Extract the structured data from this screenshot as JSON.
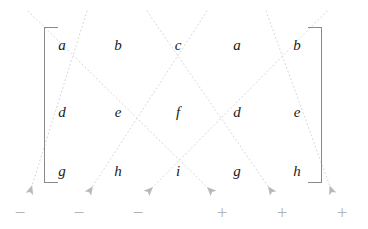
{
  "figure": {
    "name": "rule-of-sarrus-diagram",
    "background_color": "#ffffff",
    "width": 368,
    "height": 229
  },
  "matrix": {
    "rows": [
      [
        "a",
        "b",
        "c",
        "a",
        "b"
      ],
      [
        "d",
        "e",
        "f",
        "d",
        "e"
      ],
      [
        "g",
        "h",
        "i",
        "g",
        "h"
      ]
    ],
    "column_x": [
      62,
      118,
      178,
      237,
      297
    ],
    "row_y": [
      45,
      112,
      171
    ],
    "text_color": "#1a1a1a",
    "bracket_color": "#8a8a8a"
  },
  "signs": {
    "items": [
      {
        "label": "−",
        "x": 20
      },
      {
        "label": "−",
        "x": 79
      },
      {
        "label": "−",
        "x": 138
      },
      {
        "label": "+",
        "x": 222
      },
      {
        "label": "+",
        "x": 282
      },
      {
        "label": "+",
        "x": 342
      }
    ],
    "y": 212,
    "color": "#b4b4b4"
  },
  "diagonals": {
    "color": "#d6d6d6",
    "arrow_color": "#b9b9b9",
    "dash": "1 3",
    "width": 1,
    "negative_lines": [
      {
        "x1": 87,
        "y1": 11,
        "x2": 30,
        "y2": 192
      },
      {
        "x1": 207,
        "y1": 11,
        "x2": 89,
        "y2": 192
      },
      {
        "x1": 327,
        "y1": 11,
        "x2": 148,
        "y2": 192
      }
    ],
    "positive_lines": [
      {
        "x1": 28,
        "y1": 11,
        "x2": 212,
        "y2": 192
      },
      {
        "x1": 147,
        "y1": 11,
        "x2": 272,
        "y2": 192
      },
      {
        "x1": 266,
        "y1": 11,
        "x2": 332,
        "y2": 192
      }
    ]
  }
}
